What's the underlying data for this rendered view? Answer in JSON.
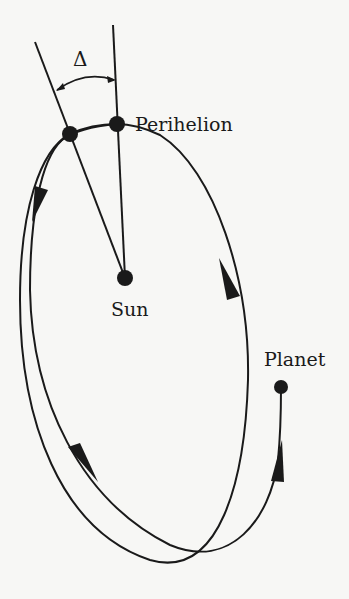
{
  "diagram": {
    "type": "orbital-precession",
    "labels": {
      "angle": "Δ",
      "perihelion": "Perihelion",
      "sun": "Sun",
      "planet": "Planet"
    },
    "colors": {
      "stroke": "#1a1a1a",
      "background": "#f7f7f5"
    },
    "nodes": [
      {
        "id": "perihelion-1",
        "label": "Perihelion",
        "x": 117,
        "y": 124
      },
      {
        "id": "perihelion-0",
        "label": "",
        "x": 70,
        "y": 134
      },
      {
        "id": "sun",
        "label": "Sun",
        "x": 125,
        "y": 278
      },
      {
        "id": "planet",
        "label": "Planet",
        "x": 281,
        "y": 387
      }
    ],
    "edges": [
      {
        "from": "sun",
        "to": "perihelion-1",
        "kind": "apsidal-line"
      },
      {
        "from": "sun",
        "to": "perihelion-0",
        "kind": "apsidal-line"
      },
      {
        "from": "perihelion-0",
        "to": "perihelion-1",
        "kind": "orbit-arc",
        "directed": true
      },
      {
        "from": "perihelion-1",
        "to": "planet",
        "kind": "orbit-path",
        "directed": true
      }
    ]
  }
}
